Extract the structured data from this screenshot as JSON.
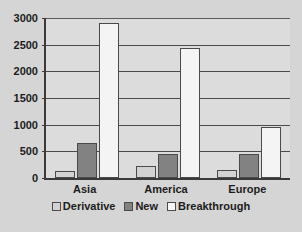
{
  "chart_data": {
    "type": "bar",
    "title": "",
    "subtitle": "",
    "xlabel": "",
    "ylabel": "",
    "categories": [
      "Asia",
      "America",
      "Europe"
    ],
    "series": [
      {
        "name": "Derivative",
        "color": "#d2d2d2",
        "values": [
          125,
          225,
          150
        ]
      },
      {
        "name": "New",
        "color": "#828282",
        "values": [
          660,
          450,
          450
        ]
      },
      {
        "name": "Breakthrough",
        "color": "#f4f4f4",
        "values": [
          2900,
          2440,
          960
        ]
      }
    ],
    "ylim": [
      0,
      3000
    ],
    "yticks": [
      0,
      500,
      1000,
      1500,
      2000,
      2500,
      3000
    ],
    "ytick_labels": [
      "0",
      "500",
      "1000",
      "1500",
      "2000",
      "2500",
      "3000"
    ],
    "grid": true,
    "grid_axis": "y",
    "legend": true,
    "legend_position": "bottom",
    "background_color": "#d5d5d5",
    "plot_background_color": "#dcdcdc",
    "axis_color": "#3a3a3a"
  }
}
